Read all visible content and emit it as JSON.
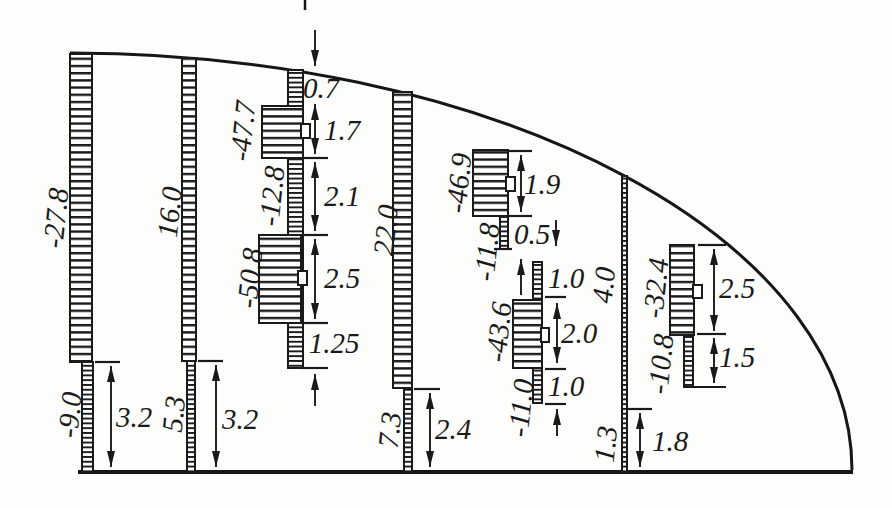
{
  "figure": {
    "stations": [
      {
        "id": "station-1",
        "upper_value": "-27.8",
        "lower_value": "-9.0",
        "lower_dim": "3.2"
      },
      {
        "id": "station-2",
        "upper_value": "16.0",
        "lower_value": "5.3",
        "lower_dim": "3.2"
      },
      {
        "id": "station-3",
        "dim_top": "0.7",
        "flange_upper_value": "-47.7",
        "dim_flange_upper": "1.7",
        "web_value": "-12.8",
        "dim_web": "2.1",
        "flange_lower_value": "-50.8",
        "dim_flange_lower": "2.5",
        "dim_bottom": "1.25"
      },
      {
        "id": "station-4",
        "upper_value": "22.0",
        "lower_value": "7.3",
        "lower_dim": "2.4"
      },
      {
        "id": "station-5",
        "flange_upper_value": "-46.9",
        "dim_flange_upper": "1.9",
        "web_upper_value": "-11.8",
        "dim_web_upper": "0.5",
        "dim_stem_upper": "1.0",
        "flange_lower_value": "-43.6",
        "dim_flange_lower": "2.0",
        "web_lower_value": "-11.0",
        "dim_stem_lower": "1.0"
      },
      {
        "id": "station-6",
        "upper_value": "4.0",
        "lower_value": "1.3",
        "lower_dim": "1.8"
      },
      {
        "id": "station-7",
        "flange_value": "-32.4",
        "dim_flange": "2.5",
        "web_value": "-10.8",
        "dim_web": "1.5"
      }
    ]
  }
}
